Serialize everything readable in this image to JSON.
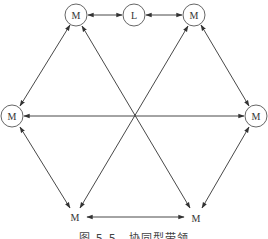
{
  "diagram": {
    "type": "network",
    "nodes": [
      {
        "id": "m_top_left",
        "label": "M",
        "circled": true
      },
      {
        "id": "l_top",
        "label": "L",
        "circled": true
      },
      {
        "id": "m_top_right",
        "label": "M",
        "circled": true
      },
      {
        "id": "m_left",
        "label": "M",
        "circled": true
      },
      {
        "id": "m_right",
        "label": "M",
        "circled": true
      },
      {
        "id": "m_bottom_left",
        "label": "M",
        "circled": false
      },
      {
        "id": "m_bottom_right",
        "label": "M",
        "circled": false
      }
    ],
    "edges": [
      {
        "from": "m_top_left",
        "to": "l_top",
        "bidirectional": true
      },
      {
        "from": "l_top",
        "to": "m_top_right",
        "bidirectional": true
      },
      {
        "from": "m_top_left",
        "to": "m_left",
        "bidirectional": true
      },
      {
        "from": "m_top_right",
        "to": "m_right",
        "bidirectional": true
      },
      {
        "from": "m_left",
        "to": "m_right",
        "bidirectional": true
      },
      {
        "from": "m_top_left",
        "to": "m_bottom_right",
        "bidirectional": true
      },
      {
        "from": "m_top_right",
        "to": "m_bottom_left",
        "bidirectional": true
      },
      {
        "from": "m_left",
        "to": "m_bottom_left",
        "bidirectional": true
      },
      {
        "from": "m_right",
        "to": "m_bottom_right",
        "bidirectional": true
      },
      {
        "from": "m_bottom_left",
        "to": "m_bottom_right",
        "bidirectional": true
      }
    ]
  },
  "caption": "图 5-5　协同型带领"
}
